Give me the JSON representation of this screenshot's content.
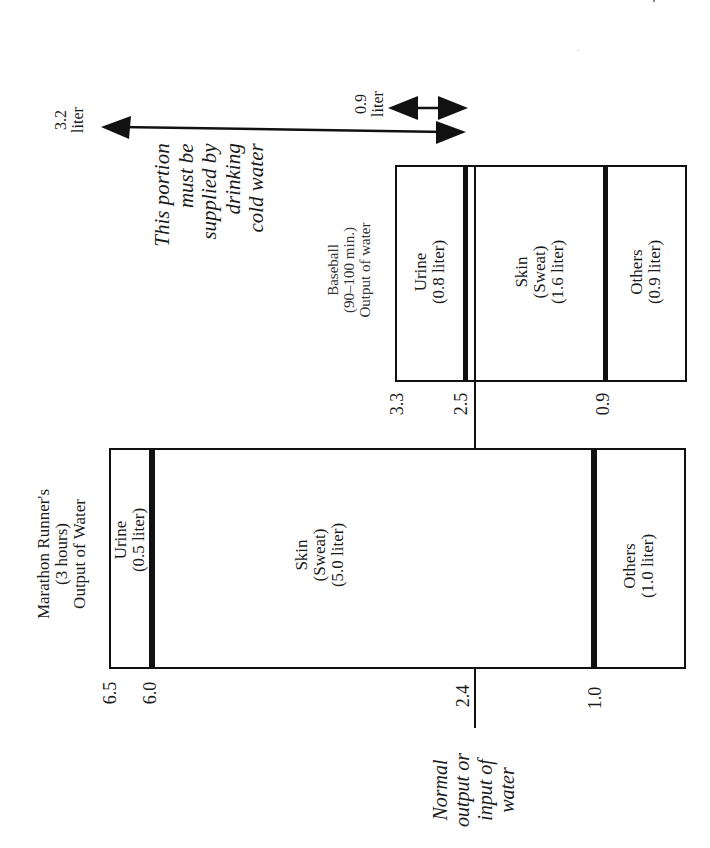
{
  "figure": {
    "orientation": "rotated 90 degrees counter-clockwise",
    "colors": {
      "ink": "#111111",
      "background": "#ffffff"
    }
  },
  "marathon": {
    "title_lines": [
      "Marathon Runner's",
      "(3 hours)",
      "Output of Water"
    ],
    "segments": [
      {
        "name": "Urine",
        "amount": "(0.5 liter)",
        "from": 6.5,
        "to": 6.0
      },
      {
        "name": "Skin",
        "sub": "(Sweat)",
        "amount": "(5.0 liter)",
        "from": 6.0,
        "to": 1.0
      },
      {
        "name": "Others",
        "amount": "(1.0 liter)",
        "from": 1.0,
        "to": 0
      }
    ],
    "ticks": [
      "6.5",
      "6.0",
      "2.4",
      "1.0"
    ]
  },
  "baseball": {
    "title_lines": [
      "Baseball",
      "(90–100 min.)",
      "Output of water"
    ],
    "segments": [
      {
        "name": "Urine",
        "amount": "(0.8 liter)",
        "from": 3.3,
        "to": 2.5
      },
      {
        "name": "Skin",
        "sub": "(Sweat)",
        "amount": "(1.6 liter)",
        "from": 2.5,
        "to": 0.9
      },
      {
        "name": "Others",
        "amount": "(0.9 liter)",
        "from": 0.9,
        "to": 0
      }
    ],
    "ticks": [
      "3.3",
      "2.5",
      "0.9"
    ]
  },
  "normal_line": {
    "value": "2.4",
    "label_lines": [
      "Normal",
      "output or",
      "input of",
      "water"
    ]
  },
  "arrows": {
    "marathon_excess": {
      "value": "3.2",
      "unit": "liter"
    },
    "baseball_excess": {
      "value": "0.9",
      "unit": "liter"
    }
  },
  "annotation": {
    "lines": [
      "This portion",
      "must be",
      "supplied by",
      "drinking",
      "cold water"
    ]
  }
}
